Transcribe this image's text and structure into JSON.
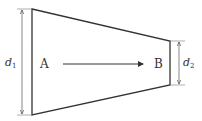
{
  "diagram": {
    "type": "tapered-pipe-section",
    "points": {
      "start": "A",
      "end": "B"
    },
    "dimensions": {
      "left": {
        "symbol": "d",
        "subscript": "1"
      },
      "right": {
        "symbol": "d",
        "subscript": "2"
      }
    },
    "flow_direction": "A to B",
    "colors": {
      "stroke": "#333333",
      "dimension": "#555555",
      "background": "#ffffff"
    }
  }
}
